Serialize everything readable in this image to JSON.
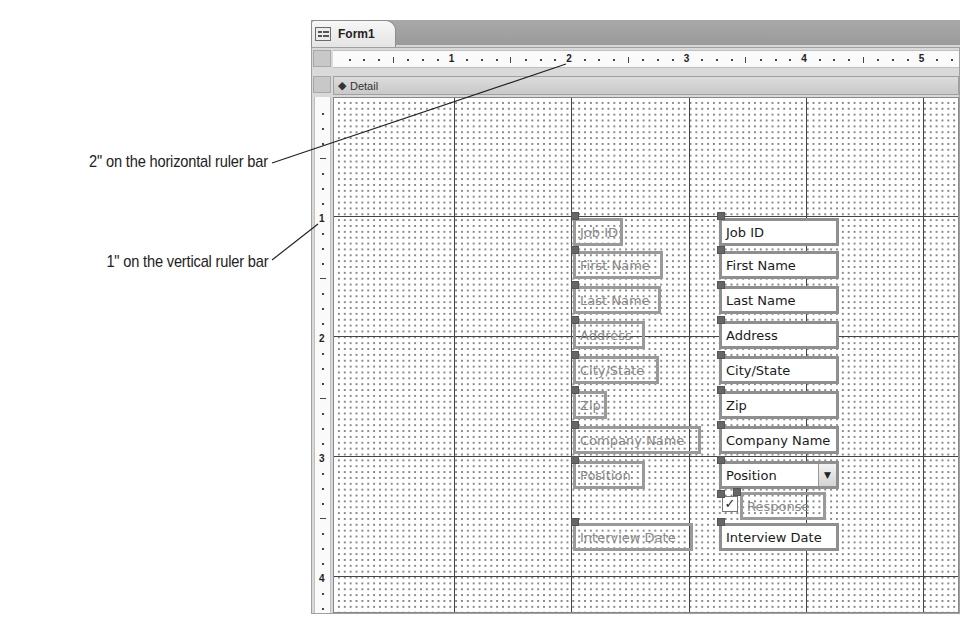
{
  "callouts": [
    {
      "text": "2\" on the horizontal ruler bar",
      "target": "horizontal ruler 2 inch mark"
    },
    {
      "text": "1\" on the vertical ruler bar",
      "target": "vertical ruler 1 inch mark"
    }
  ],
  "window": {
    "tab_label": "Form1",
    "tab_icon": "form-icon"
  },
  "horizontal_ruler": {
    "labels": [
      "1",
      "2",
      "3",
      "4",
      "5"
    ]
  },
  "vertical_ruler": {
    "labels": [
      "1",
      "2",
      "3",
      "4"
    ]
  },
  "section": {
    "icon": "down-arrow-icon",
    "label": "Detail"
  },
  "labels": [
    "Job ID",
    "First Name",
    "Last Name",
    "Address",
    "City/State",
    "Zip",
    "Company Name",
    "Position",
    "Interview Date"
  ],
  "fields": {
    "job_id": "Job ID",
    "first_name": "First Name",
    "last_name": "Last Name",
    "address": "Address",
    "city_state": "City/State",
    "zip": "Zip",
    "company_name": "Company Name",
    "position": "Position",
    "response_label": "Response",
    "response_checked": "✓",
    "interview_date": "Interview Date"
  },
  "combo_arrow": "▼"
}
